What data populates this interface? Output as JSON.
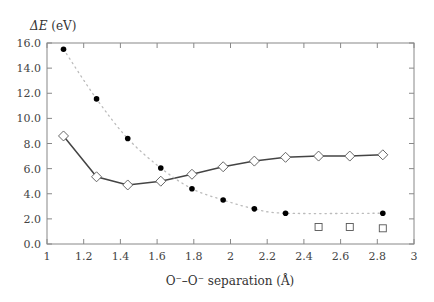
{
  "chart_data": {
    "type": "line",
    "title": "",
    "ylabel": "ΔE (eV)",
    "ylabel_italic_part": "ΔE",
    "ylabel_unit_part": " (eV)",
    "xlabel": "O⁻–O⁻ separation (Å)",
    "xlim": [
      1,
      3
    ],
    "ylim": [
      0,
      16
    ],
    "xticks": [
      1,
      1.2,
      1.4,
      1.6,
      1.8,
      2,
      2.2,
      2.4,
      2.6,
      2.8,
      3
    ],
    "xtick_labels": [
      "1",
      "1.2",
      "1.4",
      "1.6",
      "1.8",
      "2",
      "2.2",
      "2.4",
      "2.6",
      "2.8",
      "3"
    ],
    "yticks": [
      0,
      2,
      4,
      6,
      8,
      10,
      12,
      14,
      16
    ],
    "ytick_labels": [
      "0.0",
      "2.0",
      "4.0",
      "6.0",
      "8.0",
      "10.0",
      "12.0",
      "14.0",
      "16.0"
    ],
    "grid": false,
    "legend": null,
    "series": [
      {
        "name": "diamonds (solid line)",
        "marker": "diamond-open",
        "line": "solid",
        "color": "#444444",
        "x": [
          1.09,
          1.27,
          1.44,
          1.62,
          1.79,
          1.96,
          2.13,
          2.3,
          2.48,
          2.65,
          2.83
        ],
        "y": [
          8.6,
          5.35,
          4.7,
          5.0,
          5.55,
          6.15,
          6.6,
          6.9,
          7.0,
          7.0,
          7.1
        ]
      },
      {
        "name": "filled circles (dotted line)",
        "marker": "circle-filled",
        "line": "dotted",
        "color": "#000000",
        "line_color": "#bbbbbb",
        "x": [
          1.09,
          1.27,
          1.44,
          1.62,
          1.79,
          1.96,
          2.13,
          2.3,
          2.83
        ],
        "y": [
          15.5,
          11.55,
          8.4,
          6.05,
          4.4,
          3.5,
          2.8,
          2.45,
          2.45
        ]
      },
      {
        "name": "open squares",
        "marker": "square-open",
        "line": "none",
        "color": "#444444",
        "x": [
          2.48,
          2.65,
          2.83
        ],
        "y": [
          1.35,
          1.35,
          1.25
        ]
      }
    ]
  }
}
